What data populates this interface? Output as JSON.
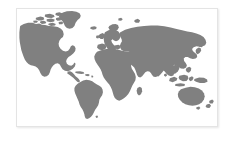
{
  "figure": {
    "kind": "world-map-silhouette",
    "projection": "robinson-like equirectangular",
    "background_color": "#ffffff",
    "card": {
      "background_color": "#ffffff",
      "border_color": "#e4e4e4",
      "shadow_color": "rgba(0,0,0,0.10)",
      "x": 16,
      "y": 8,
      "width": 202,
      "height": 119
    },
    "map": {
      "land_color": "#808080",
      "ocean_color": "#ffffff",
      "borders_shown": false,
      "labels_shown": false,
      "graticule_shown": false,
      "antarctica_shown": false,
      "landmasses": [
        "north-america",
        "greenland",
        "canadian-arctic-archipelago",
        "central-america",
        "caribbean",
        "south-america",
        "europe",
        "british-isles",
        "scandinavia",
        "iceland",
        "africa",
        "madagascar",
        "asia",
        "siberia",
        "india",
        "arabian-peninsula",
        "japan",
        "southeast-asia",
        "indonesia",
        "philippines",
        "new-guinea",
        "australia",
        "new-zealand"
      ]
    }
  }
}
